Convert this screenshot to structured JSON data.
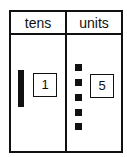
{
  "table": {
    "columns": [
      {
        "header": "tens",
        "value": "1",
        "blocks": 1,
        "block_type": "rod"
      },
      {
        "header": "units",
        "value": "5",
        "blocks": 5,
        "block_type": "cube"
      }
    ]
  },
  "colors": {
    "ink": "#111111",
    "background": "#ffffff"
  }
}
